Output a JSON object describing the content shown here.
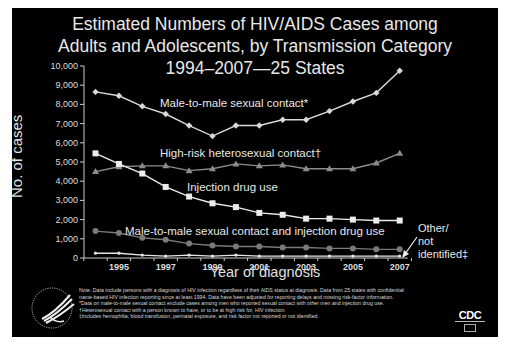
{
  "title": {
    "line1": "Estimated Numbers of HIV/AIDS Cases among",
    "line2": "Adults and Adolescents, by Transmission Category",
    "line3": "1994–2007—25 States"
  },
  "axes": {
    "ylabel": "No. of cases",
    "xlabel": "Year of diagnosis",
    "yticks": [
      "0",
      "1,000",
      "2,000",
      "3,000",
      "4,000",
      "5,000",
      "6,000",
      "7,000",
      "8,000",
      "9,000",
      "10,000"
    ],
    "xticks": [
      "1995",
      "1997",
      "1999",
      "2001",
      "2003",
      "2005",
      "2007"
    ]
  },
  "series_labels": {
    "msm": "Male-to-male sexual contact*",
    "hetero": "High-risk heterosexual contact†",
    "idu": "Injection drug use",
    "msm_idu": "Male-to-male sexual contact and injection drug use",
    "other_1": "Other/",
    "other_2": "not",
    "other_3": "identified‡"
  },
  "notes": [
    "Note. Data include persons with a diagnosis of HIV infection regardless of their AIDS status at diagnosis. Data from 25 states with confidential",
    "name-based HIV infection reporting since at least 1994. Data have been adjusted for reporting delays and missing risk-factor information.",
    "*Data on male-to-male sexual contact exclude cases among men who reported sexual contact with other men and injection drug use.",
    "†Heterosexual contact with a person known to have, or to be at high risk for, HIV infection.",
    "‡Includes hemophilia, blood transfusion, perinatal exposure, and risk factor not reported or not identified."
  ],
  "logos": {
    "cdc": "CDC",
    "hhs": "hhs-eagle-icon"
  },
  "colors": {
    "background": "#000000",
    "msm": "#d9d9d9",
    "hetero": "#8c8c8c",
    "idu": "#ececec",
    "msm_idu": "#7a7a7a",
    "other": "#e6e6e6",
    "text": "#e8e8e8"
  },
  "chart_data": {
    "type": "line",
    "xlabel": "Year of diagnosis",
    "ylabel": "No. of cases",
    "ylim": [
      0,
      10000
    ],
    "grid": false,
    "x": [
      1994,
      1995,
      1996,
      1997,
      1998,
      1999,
      2000,
      2001,
      2002,
      2003,
      2004,
      2005,
      2006,
      2007
    ],
    "series": [
      {
        "name": "Male-to-male sexual contact*",
        "marker": "diamond",
        "values": [
          8650,
          8450,
          7900,
          7500,
          6900,
          6350,
          6900,
          6900,
          7200,
          7200,
          7650,
          8150,
          8600,
          9750
        ]
      },
      {
        "name": "High-risk heterosexual contact†",
        "marker": "triangle",
        "values": [
          4500,
          4750,
          4800,
          4800,
          4550,
          4650,
          4900,
          4800,
          4850,
          4650,
          4650,
          4650,
          4950,
          5450
        ]
      },
      {
        "name": "Injection drug use",
        "marker": "square",
        "values": [
          5450,
          4900,
          4400,
          3700,
          3200,
          2850,
          2650,
          2350,
          2250,
          2050,
          2050,
          2000,
          1950,
          1950
        ]
      },
      {
        "name": "Male-to-male sexual contact and injection drug use",
        "marker": "circle",
        "values": [
          1400,
          1300,
          1050,
          950,
          750,
          650,
          600,
          600,
          550,
          550,
          500,
          500,
          450,
          450
        ]
      },
      {
        "name": "Other/not identified‡",
        "marker": "cross",
        "values": [
          250,
          250,
          150,
          100,
          150,
          100,
          150,
          100,
          100,
          100,
          100,
          100,
          100,
          100
        ]
      }
    ]
  }
}
